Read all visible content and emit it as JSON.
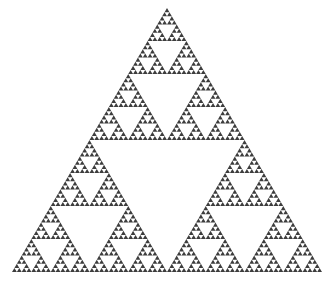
{
  "figure": {
    "name": "sierpinski-triangle",
    "caption": "",
    "background_color": "#ffffff",
    "fill_color": "#3d3d3d",
    "canvas": {
      "width": 331,
      "height": 290
    }
  },
  "chart_data": {
    "type": "scatter",
    "subtitle": "",
    "xlabel": "",
    "ylabel": "",
    "grid": false,
    "legend": null,
    "annotations": [],
    "fractal": {
      "name": "Sierpinski triangle",
      "construction": "recursive midpoint subdivision of an equilateral triangle, removing the central inverted triangle at each step",
      "iterations": 6,
      "filled_triangles_at_depth": 729,
      "triangles_along_base_at_depth_4": 16,
      "hausdorff_dimension": 1.585,
      "fill_color": "#3d3d3d",
      "background_color": "#ffffff",
      "vertices": {
        "apex": [
          167,
          8
        ],
        "bottom_left": [
          12,
          272
        ],
        "bottom_right": [
          322,
          272
        ]
      },
      "base_width": 310,
      "height": 264
    },
    "xlim": [
      0,
      331
    ],
    "ylim": [
      0,
      290
    ]
  }
}
